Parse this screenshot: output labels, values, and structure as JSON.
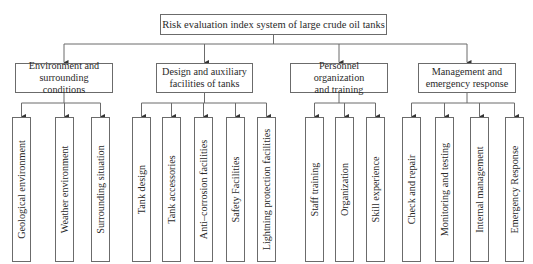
{
  "diagram": {
    "type": "hierarchy-tree",
    "root": {
      "label": "Risk evaluation index system of large crude oil tanks"
    },
    "categories": [
      {
        "label_lines": [
          "Environment and",
          "surrounding conditions"
        ],
        "children": [
          "Geological environment",
          "Weather environment",
          "Surrounding situation"
        ]
      },
      {
        "label_lines": [
          "Design and auxiliary",
          "facilities of tanks"
        ],
        "children": [
          "Tank design",
          "Tank accessories",
          "Anti–corrosion facilities",
          "Safety Facilities",
          "Lightning protection facilities"
        ]
      },
      {
        "label_lines": [
          "Personnel organization",
          "and training"
        ],
        "children": [
          "Staff training",
          "Organization",
          "Skill experience"
        ]
      },
      {
        "label_lines": [
          "Management and",
          "emergency response"
        ],
        "children": [
          "Check and repair",
          "Monitoring and testing",
          "Internal management",
          "Emergency Response"
        ]
      }
    ],
    "colors": {
      "line": "#6b6b6b",
      "text": "#2a2a2a",
      "background": "#ffffff"
    }
  }
}
